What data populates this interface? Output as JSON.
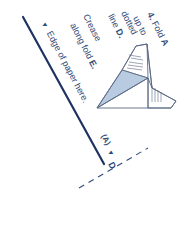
{
  "instruction": {
    "step_number": "4.",
    "lines": [
      {
        "text": "Fold ",
        "bold_suffix": "A"
      },
      {
        "text": "up to",
        "bold_suffix": ""
      },
      {
        "text": "dotted",
        "bold_suffix": ""
      },
      {
        "text": "line ",
        "bold_suffix": "D."
      },
      {
        "text": "Crease",
        "bold_suffix": ""
      },
      {
        "text": "along fold ",
        "bold_suffix": "E."
      }
    ]
  },
  "edge_label": {
    "marker": "▼",
    "text": "Edge of paper here."
  },
  "fold_labels": {
    "a_label": "(A)",
    "a_marker": "▼",
    "d_label": "D"
  },
  "colors": {
    "text": "#2f4a78",
    "edge_line": "#1f3363",
    "diagram_stroke": "#5a6a85",
    "diagram_fill": "#b9cbe0",
    "dashed_line": "#2f4a78",
    "background": "#ffffff"
  }
}
